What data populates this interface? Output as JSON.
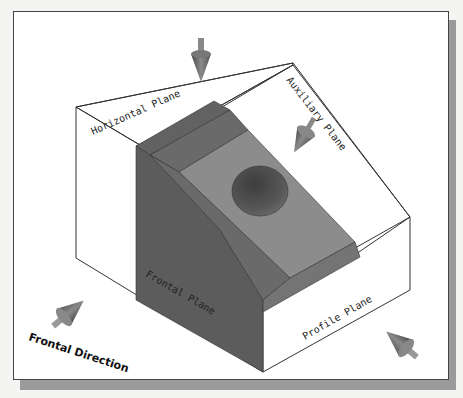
{
  "figure": {
    "planes": {
      "horizontal": "Horizontal Plane",
      "auxiliary": "Auxiliary Plane",
      "frontal": "Frontal Plane",
      "profile": "Profile Plane"
    },
    "direction_label": "Frontal Direction",
    "arrows": [
      {
        "name": "horizontal-view-arrow",
        "direction": "down"
      },
      {
        "name": "auxiliary-view-arrow",
        "direction": "down-left"
      },
      {
        "name": "frontal-view-arrow",
        "direction": "up-right"
      },
      {
        "name": "profile-view-arrow",
        "direction": "up-left"
      }
    ],
    "colors": {
      "part_dark": "#5c5c5c",
      "part_mid": "#6e6e6e",
      "part_light": "#8a8a8a",
      "hole": "#4a4a4a",
      "arrow": "#7a7a7a",
      "frame_shadow": "#9a9a9a"
    }
  }
}
